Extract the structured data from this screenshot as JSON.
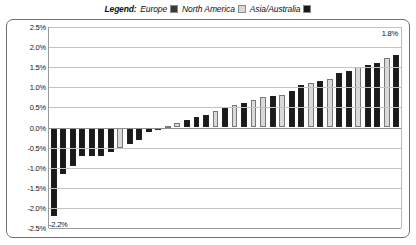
{
  "legend": {
    "title": "Legend:",
    "entries": [
      {
        "label": "Europe",
        "color": "#3a3a3a",
        "icon": "legend-swatch-europe"
      },
      {
        "label": "North America",
        "color": "#d9d9d9",
        "icon": "legend-swatch-north-america"
      },
      {
        "label": "Asia/Australia",
        "color": "#1a1a1a",
        "icon": "legend-swatch-asia-australia"
      }
    ]
  },
  "annotations": {
    "max_label": "1.8%",
    "min_label": "-2.2%"
  },
  "chart_data": {
    "type": "bar",
    "title": "",
    "subtitle": "",
    "xlabel": "",
    "ylabel": "",
    "ylim": [
      -2.5,
      2.5
    ],
    "grid": true,
    "legend_position": "top-center",
    "tick_labels": [
      "2.5%",
      "2.0%",
      "1.5%",
      "1.0%",
      "0.5%",
      "0.0%",
      "-0.5%",
      "-1.0%",
      "-1.5%",
      "-2.0%",
      "-2.5%"
    ],
    "ticks": [
      2.5,
      2.0,
      1.5,
      1.0,
      0.5,
      0.0,
      -0.5,
      -1.0,
      -1.5,
      -2.0,
      -2.5
    ],
    "series": [
      {
        "name": "Europe",
        "color": "#3a3a3a"
      },
      {
        "name": "North America",
        "color": "#d9d9d9"
      },
      {
        "name": "Asia/Australia",
        "color": "#1a1a1a"
      }
    ],
    "categories": [
      "1",
      "2",
      "3",
      "4",
      "5",
      "6",
      "7",
      "8",
      "9",
      "10",
      "11",
      "12",
      "13",
      "14",
      "15",
      "16",
      "17",
      "18",
      "19",
      "20",
      "21",
      "22",
      "23",
      "24",
      "25",
      "26",
      "27",
      "28",
      "29",
      "30",
      "31",
      "32",
      "33",
      "34",
      "35",
      "36",
      "37"
    ],
    "values": [
      -2.2,
      -1.15,
      -0.95,
      -0.72,
      -0.72,
      -0.7,
      -0.62,
      -0.5,
      -0.42,
      -0.3,
      -0.1,
      -0.05,
      0.03,
      0.1,
      0.18,
      0.25,
      0.32,
      0.4,
      0.48,
      0.55,
      0.62,
      0.68,
      0.75,
      0.78,
      0.82,
      0.9,
      1.05,
      1.1,
      1.15,
      1.2,
      1.35,
      1.4,
      1.5,
      1.55,
      1.6,
      1.72,
      1.8
    ],
    "point_groups": [
      "Asia/Australia",
      "Asia/Australia",
      "Asia/Australia",
      "Asia/Australia",
      "Asia/Australia",
      "Asia/Australia",
      "Asia/Australia",
      "North America",
      "Asia/Australia",
      "Asia/Australia",
      "Asia/Australia",
      "Europe",
      "North America",
      "North America",
      "Asia/Australia",
      "Asia/Australia",
      "Asia/Australia",
      "North America",
      "Asia/Australia",
      "North America",
      "Asia/Australia",
      "North America",
      "North America",
      "Asia/Australia",
      "North America",
      "Asia/Australia",
      "Asia/Australia",
      "North America",
      "Asia/Australia",
      "North America",
      "Asia/Australia",
      "Asia/Australia",
      "North America",
      "Asia/Australia",
      "Asia/Australia",
      "North America",
      "Asia/Australia"
    ]
  }
}
